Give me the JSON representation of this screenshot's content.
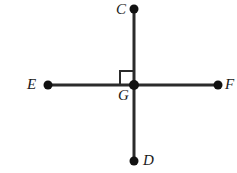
{
  "figure": {
    "background_color": "#ffffff",
    "stroke_color": "#2b2b2b",
    "point_color": "#111111",
    "label_color": "#1a1a1a",
    "line_width": 3,
    "point_radius": 4.5,
    "width": 237,
    "height": 173
  },
  "points": {
    "C": {
      "label": "C",
      "x": 134,
      "y": 9,
      "label_x": 116,
      "label_y": 2,
      "dot": true
    },
    "D": {
      "label": "D",
      "x": 134,
      "y": 161,
      "label_x": 143,
      "label_y": 153,
      "dot": true
    },
    "E": {
      "label": "E",
      "x": 48,
      "y": 85,
      "label_x": 27,
      "label_y": 77,
      "dot": true
    },
    "F": {
      "label": "F",
      "x": 218,
      "y": 85,
      "label_x": 225,
      "label_y": 77,
      "dot": true
    },
    "G": {
      "label": "G",
      "x": 134,
      "y": 85,
      "label_x": 118,
      "label_y": 88,
      "dot": true
    }
  },
  "segments": [
    {
      "name": "vertical-line-CD",
      "x1": 134,
      "y1": 9,
      "x2": 134,
      "y2": 161
    },
    {
      "name": "horizontal-line-EF",
      "x1": 48,
      "y1": 85,
      "x2": 218,
      "y2": 85
    }
  ],
  "right_angle_marker": {
    "name": "right-angle-marker",
    "quadrant": "upper-left",
    "size": 14,
    "x": 120,
    "y": 71,
    "stroke_width": 2
  },
  "labels_list": [
    "C",
    "D",
    "E",
    "F",
    "G"
  ]
}
